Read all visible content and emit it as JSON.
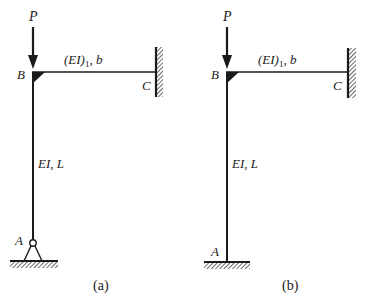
{
  "diagrams": [
    {
      "id": "a",
      "caption": "(a)",
      "load_label": "P",
      "joint_B_label": "B",
      "joint_C_label": "C",
      "joint_A_label": "A",
      "beam_label_main": "(EI)",
      "beam_label_sub": "1",
      "beam_label_tail": ", b",
      "column_label": "EI, L",
      "support_A": "pinned",
      "support_C": "fixed"
    },
    {
      "id": "b",
      "caption": "(b)",
      "load_label": "P",
      "joint_B_label": "B",
      "joint_C_label": "C",
      "joint_A_label": "A",
      "beam_label_main": "(EI)",
      "beam_label_sub": "1",
      "beam_label_tail": ", b",
      "column_label": "EI, L",
      "support_A": "fixed",
      "support_C": "fixed"
    }
  ],
  "colors": {
    "line": "#1a1a1a",
    "background": "#ffffff"
  }
}
